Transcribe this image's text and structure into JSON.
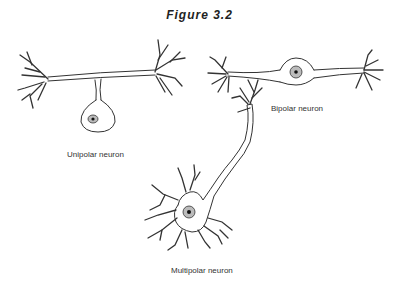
{
  "figure": {
    "title": "Figure 3.2"
  },
  "neurons": [
    {
      "id": "unipolar",
      "label": "Unipolar neuron"
    },
    {
      "id": "bipolar",
      "label": "Bipolar neuron"
    },
    {
      "id": "multipolar",
      "label": "Multipolar neuron"
    }
  ],
  "colors": {
    "line": "#333333",
    "nucleus_fill": "#bbbbbb",
    "nucleolus": "#111111",
    "background": "#ffffff"
  }
}
